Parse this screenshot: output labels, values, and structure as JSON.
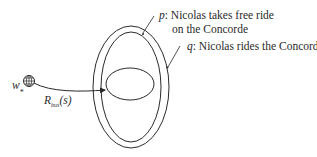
{
  "diagram": {
    "world_label": "w",
    "world_subscript": "*",
    "arrow_label": {
      "name": "R",
      "subscript": "bus",
      "argument": "(s)"
    },
    "sets": [
      {
        "id": "p",
        "letter": "p",
        "text": ": Nicolas takes free ride",
        "text_line2": "on the Concorde"
      },
      {
        "id": "q",
        "letter": "q",
        "text": ": Nicolas rides the Concorde"
      }
    ],
    "colors": {
      "stroke": "#2a2a2a",
      "background": "#ffffff"
    }
  }
}
